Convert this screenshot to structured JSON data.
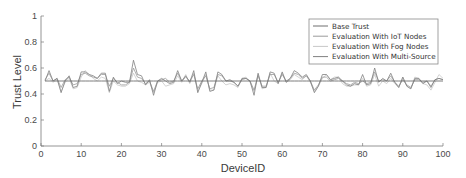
{
  "chart_data": {
    "type": "line",
    "title": "",
    "xlabel": "DeviceID",
    "ylabel": "Trust Level",
    "xlim": [
      0,
      100
    ],
    "ylim": [
      0,
      1
    ],
    "xticks": [
      0,
      10,
      20,
      30,
      40,
      50,
      60,
      70,
      80,
      90,
      100
    ],
    "xtick_labels": [
      "0",
      "10",
      "20",
      "30",
      "40",
      "50",
      "60",
      "70",
      "80",
      "90",
      "100"
    ],
    "yticks": [
      0,
      0.2,
      0.4,
      0.6,
      0.8,
      1
    ],
    "ytick_labels": [
      "0",
      "0.2",
      "0.4",
      "0.6",
      "0.8",
      "1"
    ],
    "grid": false,
    "legend_position": "upper right",
    "x": [
      1,
      2,
      3,
      4,
      5,
      6,
      7,
      8,
      9,
      10,
      11,
      12,
      13,
      14,
      15,
      16,
      17,
      18,
      19,
      20,
      21,
      22,
      23,
      24,
      25,
      26,
      27,
      28,
      29,
      30,
      31,
      32,
      33,
      34,
      35,
      36,
      37,
      38,
      39,
      40,
      41,
      42,
      43,
      44,
      45,
      46,
      47,
      48,
      49,
      50,
      51,
      52,
      53,
      54,
      55,
      56,
      57,
      58,
      59,
      60,
      61,
      62,
      63,
      64,
      65,
      66,
      67,
      68,
      69,
      70,
      71,
      72,
      73,
      74,
      75,
      76,
      77,
      78,
      79,
      80,
      81,
      82,
      83,
      84,
      85,
      86,
      87,
      88,
      89,
      90,
      91,
      92,
      93,
      94,
      95,
      96,
      97,
      98,
      99,
      100
    ],
    "series": [
      {
        "name": "Base Trust",
        "color": "#6e6e6e",
        "values": [
          0.5,
          0.5,
          0.5,
          0.5,
          0.5,
          0.5,
          0.5,
          0.5,
          0.5,
          0.5,
          0.5,
          0.5,
          0.5,
          0.5,
          0.5,
          0.5,
          0.5,
          0.5,
          0.5,
          0.5,
          0.5,
          0.5,
          0.5,
          0.5,
          0.5,
          0.5,
          0.5,
          0.5,
          0.5,
          0.5,
          0.5,
          0.5,
          0.5,
          0.5,
          0.5,
          0.5,
          0.5,
          0.5,
          0.5,
          0.5,
          0.5,
          0.5,
          0.5,
          0.5,
          0.5,
          0.5,
          0.5,
          0.5,
          0.5,
          0.5,
          0.5,
          0.5,
          0.5,
          0.5,
          0.5,
          0.5,
          0.5,
          0.5,
          0.5,
          0.5,
          0.5,
          0.5,
          0.5,
          0.5,
          0.5,
          0.5,
          0.5,
          0.5,
          0.5,
          0.5,
          0.5,
          0.5,
          0.5,
          0.5,
          0.5,
          0.5,
          0.5,
          0.5,
          0.5,
          0.5,
          0.5,
          0.5,
          0.5,
          0.5,
          0.5,
          0.5,
          0.5,
          0.5,
          0.5,
          0.5,
          0.5,
          0.5,
          0.5,
          0.5,
          0.5,
          0.5,
          0.5,
          0.5,
          0.5,
          0.5
        ]
      },
      {
        "name": "Evaluation With IoT Nodes",
        "color": "#9a9a9a",
        "values": [
          0.51,
          0.56,
          0.5,
          0.52,
          0.45,
          0.51,
          0.53,
          0.47,
          0.48,
          0.55,
          0.56,
          0.54,
          0.53,
          0.52,
          0.55,
          0.55,
          0.46,
          0.52,
          0.49,
          0.47,
          0.47,
          0.49,
          0.6,
          0.53,
          0.52,
          0.48,
          0.5,
          0.42,
          0.5,
          0.51,
          0.52,
          0.49,
          0.5,
          0.56,
          0.5,
          0.53,
          0.5,
          0.55,
          0.44,
          0.5,
          0.54,
          0.44,
          0.45,
          0.55,
          0.54,
          0.5,
          0.5,
          0.49,
          0.46,
          0.51,
          0.52,
          0.5,
          0.43,
          0.54,
          0.46,
          0.46,
          0.55,
          0.55,
          0.49,
          0.55,
          0.5,
          0.52,
          0.56,
          0.55,
          0.52,
          0.54,
          0.5,
          0.43,
          0.47,
          0.53,
          0.53,
          0.5,
          0.51,
          0.52,
          0.5,
          0.48,
          0.47,
          0.49,
          0.48,
          0.5,
          0.48,
          0.49,
          0.57,
          0.5,
          0.51,
          0.5,
          0.54,
          0.49,
          0.46,
          0.51,
          0.47,
          0.45,
          0.51,
          0.51,
          0.49,
          0.5,
          0.46,
          0.51,
          0.52,
          0.51
        ]
      },
      {
        "name": "Evaluation With Fog Nodes",
        "color": "#c8c8c8",
        "values": [
          0.5,
          0.52,
          0.49,
          0.51,
          0.42,
          0.49,
          0.52,
          0.44,
          0.45,
          0.53,
          0.58,
          0.55,
          0.52,
          0.5,
          0.53,
          0.52,
          0.41,
          0.5,
          0.47,
          0.46,
          0.46,
          0.48,
          0.56,
          0.5,
          0.49,
          0.47,
          0.49,
          0.41,
          0.49,
          0.5,
          0.46,
          0.47,
          0.48,
          0.54,
          0.49,
          0.55,
          0.48,
          0.56,
          0.42,
          0.48,
          0.55,
          0.43,
          0.43,
          0.54,
          0.5,
          0.47,
          0.48,
          0.47,
          0.45,
          0.52,
          0.53,
          0.49,
          0.42,
          0.55,
          0.44,
          0.45,
          0.56,
          0.5,
          0.48,
          0.56,
          0.49,
          0.51,
          0.55,
          0.53,
          0.51,
          0.54,
          0.49,
          0.42,
          0.46,
          0.52,
          0.55,
          0.51,
          0.53,
          0.53,
          0.48,
          0.46,
          0.46,
          0.47,
          0.47,
          0.52,
          0.46,
          0.47,
          0.55,
          0.46,
          0.5,
          0.48,
          0.52,
          0.48,
          0.45,
          0.53,
          0.46,
          0.44,
          0.53,
          0.52,
          0.48,
          0.47,
          0.43,
          0.49,
          0.55,
          0.52
        ]
      },
      {
        "name": "Evaluation With Multi-Source",
        "color": "#808080",
        "values": [
          0.5,
          0.58,
          0.5,
          0.52,
          0.41,
          0.5,
          0.54,
          0.45,
          0.46,
          0.57,
          0.57,
          0.55,
          0.54,
          0.52,
          0.56,
          0.56,
          0.42,
          0.53,
          0.48,
          0.5,
          0.49,
          0.49,
          0.66,
          0.55,
          0.54,
          0.47,
          0.51,
          0.39,
          0.5,
          0.52,
          0.5,
          0.48,
          0.49,
          0.58,
          0.5,
          0.54,
          0.49,
          0.58,
          0.41,
          0.49,
          0.57,
          0.42,
          0.43,
          0.57,
          0.55,
          0.5,
          0.51,
          0.49,
          0.46,
          0.52,
          0.52,
          0.5,
          0.39,
          0.56,
          0.45,
          0.45,
          0.57,
          0.56,
          0.48,
          0.57,
          0.49,
          0.52,
          0.58,
          0.56,
          0.53,
          0.55,
          0.5,
          0.41,
          0.46,
          0.55,
          0.55,
          0.51,
          0.52,
          0.53,
          0.5,
          0.47,
          0.46,
          0.48,
          0.47,
          0.55,
          0.47,
          0.48,
          0.6,
          0.49,
          0.52,
          0.5,
          0.56,
          0.49,
          0.45,
          0.53,
          0.46,
          0.44,
          0.52,
          0.52,
          0.48,
          0.5,
          0.45,
          0.51,
          0.52,
          0.51
        ]
      }
    ]
  }
}
